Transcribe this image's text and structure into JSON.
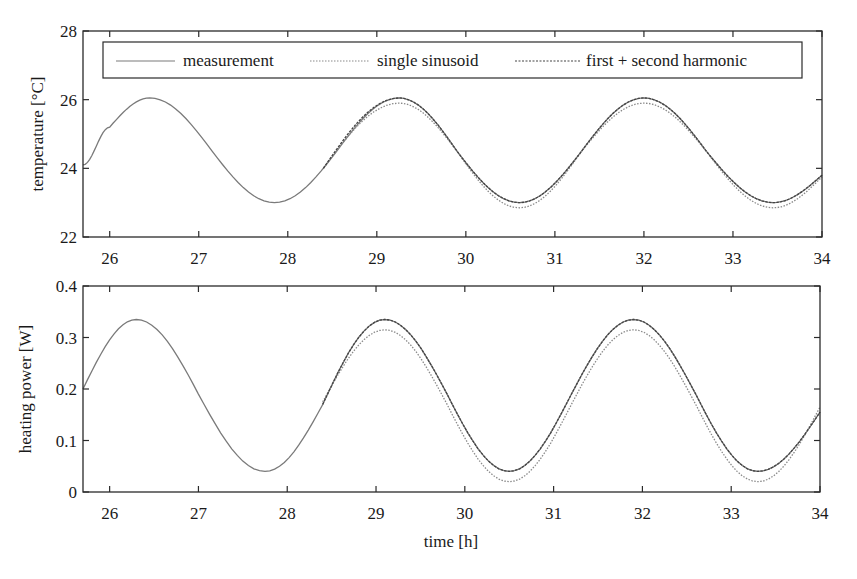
{
  "chart_data": [
    {
      "type": "line",
      "title": "",
      "xlabel": "",
      "ylabel": "temperature [°C]",
      "xlim": [
        25.7,
        34
      ],
      "ylim": [
        22,
        28
      ],
      "xticks": [
        26,
        27,
        28,
        29,
        30,
        31,
        32,
        33,
        34
      ],
      "yticks": [
        22,
        24,
        26,
        28
      ],
      "grid": false,
      "legend": {
        "position": "top inside",
        "entries": [
          "measurement",
          "single sinusoid",
          "first + second harmonic"
        ]
      },
      "series": [
        {
          "name": "measurement",
          "style": "solid",
          "x": [
            25.7,
            26.0,
            26.45,
            27.15,
            27.85,
            28.55,
            29.25,
            29.9,
            30.6,
            31.3,
            32.0,
            32.7,
            33.45,
            34.0
          ],
          "y": [
            24.1,
            25.2,
            26.05,
            24.5,
            23.0,
            24.5,
            26.05,
            24.5,
            23.0,
            24.5,
            26.05,
            24.5,
            23.0,
            23.8
          ]
        },
        {
          "name": "single sinusoid",
          "style": "dotted",
          "x": [
            28.4,
            29.25,
            29.9,
            30.6,
            31.3,
            32.0,
            32.7,
            33.45,
            34.0
          ],
          "y": [
            24.0,
            25.9,
            24.5,
            22.85,
            24.5,
            25.9,
            24.5,
            22.85,
            23.75
          ]
        },
        {
          "name": "first + second harmonic",
          "style": "dashed",
          "x": [
            28.4,
            29.25,
            29.9,
            30.6,
            31.3,
            32.0,
            32.7,
            33.45,
            34.0
          ],
          "y": [
            24.0,
            26.05,
            24.5,
            23.0,
            24.5,
            26.05,
            24.5,
            23.0,
            23.8
          ]
        }
      ]
    },
    {
      "type": "line",
      "title": "",
      "xlabel": "time [h]",
      "ylabel": "heating power [W]",
      "xlim": [
        25.7,
        34
      ],
      "ylim": [
        0,
        0.4
      ],
      "xticks": [
        26,
        27,
        28,
        29,
        30,
        31,
        32,
        33,
        34
      ],
      "yticks": [
        0,
        0.1,
        0.2,
        0.3,
        0.4
      ],
      "grid": false,
      "series": [
        {
          "name": "measurement",
          "style": "solid",
          "x": [
            25.7,
            26.3,
            27.0,
            27.75,
            28.4,
            29.1,
            29.8,
            30.5,
            31.2,
            31.9,
            32.6,
            33.3,
            34.0
          ],
          "y": [
            0.2,
            0.335,
            0.19,
            0.04,
            0.17,
            0.335,
            0.19,
            0.04,
            0.19,
            0.335,
            0.19,
            0.04,
            0.155
          ]
        },
        {
          "name": "single sinusoid",
          "style": "dotted",
          "x": [
            28.4,
            29.1,
            29.8,
            30.5,
            31.2,
            31.9,
            32.6,
            33.3,
            34.0
          ],
          "y": [
            0.175,
            0.315,
            0.17,
            0.02,
            0.17,
            0.315,
            0.17,
            0.02,
            0.165
          ]
        },
        {
          "name": "first + second harmonic",
          "style": "dashed",
          "x": [
            28.4,
            29.1,
            29.8,
            30.5,
            31.2,
            31.9,
            32.6,
            33.3,
            34.0
          ],
          "y": [
            0.17,
            0.335,
            0.19,
            0.04,
            0.19,
            0.335,
            0.19,
            0.04,
            0.155
          ]
        }
      ]
    }
  ],
  "figure": {
    "top": {
      "ylabel": "temperature [°C]",
      "ytick_labels": [
        "22",
        "24",
        "26",
        "28"
      ],
      "xtick_labels": [
        "26",
        "27",
        "28",
        "29",
        "30",
        "31",
        "32",
        "33",
        "34"
      ],
      "legend": [
        "measurement",
        "single sinusoid",
        "first + second harmonic"
      ]
    },
    "bottom": {
      "ylabel": "heating power [W]",
      "xlabel": "time [h]",
      "ytick_labels": [
        "0",
        "0.1",
        "0.2",
        "0.3",
        "0.4"
      ],
      "xtick_labels": [
        "26",
        "27",
        "28",
        "29",
        "30",
        "31",
        "32",
        "33",
        "34"
      ]
    },
    "colors": {
      "axis": "#2a2a2a",
      "measurement": "#7a7a7a",
      "single": "#8a8a8a",
      "harmonic": "#444444"
    }
  }
}
